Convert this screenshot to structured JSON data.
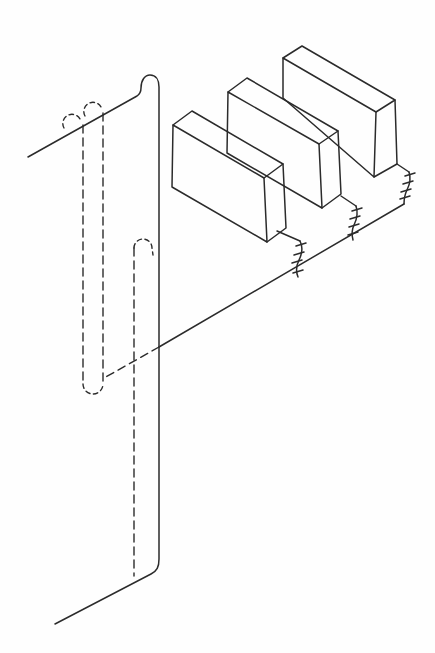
{
  "figure": {
    "colors": {
      "line": "#2b2b2b",
      "background": "#fefefe"
    },
    "stroke": {
      "solid_width": "1.5",
      "dashed_width": "1.4",
      "dash_long": "8 5",
      "dash_short": "4.5 3.5"
    },
    "paths": {
      "plate_outline": "M 28 157 L 137 96 C 140 94 141 92 141 88 C 141 80 145 75 150 75 C 156 75 159 80 159 87 L 159 559 C 159 567 157 571 151 574 L 55 624",
      "flange_edge": "M 404 204 L 159 347",
      "block1_front": "M 173 125 L 264 178 L 267 242 L 172 187 Z",
      "block1_top": "M 173 125 L 192 111 L 283 164 L 264 178",
      "block1_side": "M 283 164 L 286 228 L 267 242",
      "block2_front": "M 228 92 L 319 144 L 322 208 L 227 153 Z",
      "block2_top": "M 228 92 L 247 78 L 338 131 L 319 144",
      "block2_side": "M 338 131 L 341 194 L 322 208",
      "block3_front": "M 283 98 L 283 58 L 376 112 L 374 177 Z",
      "block3_top": "M 283 58 L 302 46 L 395 100 L 376 112",
      "block3_side": "M 395 100 L 397 164 L 374 177",
      "break1_connector": "M 277 231 L 300 241",
      "break1_squiggle": "M 300 241 C 303 247 302 254 299 260 C 296 266 296 272 298 277",
      "break1_ticks": "M 296 246 L 306 243 M 294 255 L 304 252 M 292 263 L 302 260 M 293 273 L 303 270",
      "break2_connector": "M 341 196 L 356 206",
      "break2_squiggle": "M 356 206 C 358 212 357 219 354 225 C 351 231 352 236 353 240",
      "break2_ticks": "M 352 211 L 362 208 M 350 219 L 360 216 M 349 227 L 359 224 M 348 235 L 358 232",
      "break3_connector": "M 397 164 L 409 172",
      "break3_squiggle": "M 409 172 C 411 178 410 184 407 190 C 404 196 404 200 404 204",
      "break3_ticks": "M 405 176 L 415 173 M 403 184 L 413 181 M 401 192 L 411 189 M 400 199 L 410 196",
      "slot_left_edge": "M 83 125 L 83 384",
      "slot_right_edge": "M 103 113 L 103 384",
      "slot_bottom_arc": "M 83 384 A 10 10 0 0 0 103 384",
      "slot_left_bump": "M 64 128 A 8.5 8.5 0 0 1 80 119",
      "slot_right_bump": "M 85 116 A 8.5 8.5 0 0 1 101 107",
      "hem_hidden_edge": "M 134 248 L 134 576",
      "hem_top_arc": "M 134 248 A 9 9 0 0 1 152 248 L 153 255",
      "flange_hidden_edge": "M 159 347 L 104 378"
    }
  }
}
